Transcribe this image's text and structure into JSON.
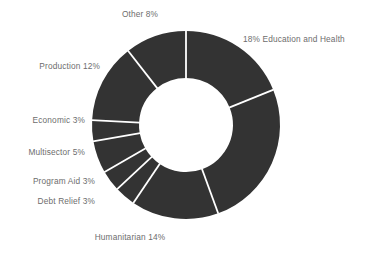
{
  "chart_data": {
    "type": "pie",
    "variant": "donut",
    "title": "",
    "subtitle": "",
    "xlabel": "",
    "ylabel": "",
    "legend_position": "none",
    "grid": false,
    "units": "percent",
    "colors": {
      "slice_fill": "#333333",
      "separator": "#ffffff",
      "background": "#ffffff",
      "label_text": "#6d6d6d"
    },
    "geometry": {
      "center_x": 186,
      "center_y": 125,
      "outer_radius": 94,
      "inner_radius": 47,
      "start_angle_deg": 0,
      "direction": "clockwise"
    },
    "categories": [
      "Education and Health",
      "Social",
      "Humanitarian",
      "Debt Relief",
      "Program Aid",
      "Multisector",
      "Economic",
      "Production",
      "Other"
    ],
    "values": [
      18,
      24,
      14,
      3,
      3,
      5,
      3,
      12,
      8
    ],
    "slices": [
      {
        "name": "Education and Health",
        "value": 18,
        "label": "18% Education and Health",
        "sweep_deg": 68,
        "label_side": "right"
      },
      {
        "name": "Social",
        "value": 24,
        "label": "24% Social",
        "sweep_deg": 92,
        "label_side": "right"
      },
      {
        "name": "Humanitarian",
        "value": 14,
        "label": "Humanitarian 14%",
        "sweep_deg": 54,
        "label_side": "bottom"
      },
      {
        "name": "Debt Relief",
        "value": 3,
        "label": "Debt Relief 3%",
        "sweep_deg": 13,
        "label_side": "left"
      },
      {
        "name": "Program Aid",
        "value": 3,
        "label": "Program Aid 3%",
        "sweep_deg": 13,
        "label_side": "left"
      },
      {
        "name": "Multisector",
        "value": 5,
        "label": "Multisector 5%",
        "sweep_deg": 20,
        "label_side": "left"
      },
      {
        "name": "Economic",
        "value": 3,
        "label": "Economic 3%",
        "sweep_deg": 13,
        "label_side": "left"
      },
      {
        "name": "Production",
        "value": 12,
        "label": "Production 12%",
        "sweep_deg": 49,
        "label_side": "left"
      },
      {
        "name": "Other",
        "value": 8,
        "label": "Other 8%",
        "sweep_deg": 38,
        "label_side": "top"
      }
    ],
    "labels": {
      "education_and_health": "18% Education and Health",
      "social": "24% Social",
      "humanitarian": "Humanitarian 14%",
      "debt_relief": "Debt Relief 3%",
      "program_aid": "Program Aid 3%",
      "multisector": "Multisector 5%",
      "economic": "Economic 3%",
      "production": "Production 12%",
      "other": "Other 8%"
    }
  }
}
